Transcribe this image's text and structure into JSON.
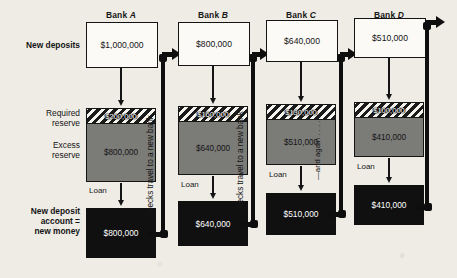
{
  "figure": {
    "type": "flow-diagram",
    "reserve_requirement": "20%"
  },
  "row_labels": {
    "new_deposits": "New deposits",
    "required_reserve": "Required\nreserve",
    "required_reserve_line1": "Required",
    "required_reserve_line2": "reserve",
    "excess_reserve_line1": "Excess",
    "excess_reserve_line2": "reserve",
    "loan": "Loan",
    "new_deposit_account_line1": "New deposit",
    "new_deposit_account_line2": "account =",
    "new_deposit_account_line3": "new money"
  },
  "connector_labels": {
    "checks_travel": "Checks travel to a new bank",
    "and_again": "—and again . . . . ."
  },
  "banks": [
    {
      "title_prefix": "Bank ",
      "title_letter": "A",
      "new_deposit": "$1,000,000",
      "required_reserve": "$200,000",
      "excess_reserve": "$800,000",
      "loan_label": "Loan",
      "new_money": "$800,000"
    },
    {
      "title_prefix": "Bank ",
      "title_letter": "B",
      "new_deposit": "$800,000",
      "required_reserve": "$160,000",
      "excess_reserve": "$640,000",
      "loan_label": "Loan",
      "new_money": "$640,000"
    },
    {
      "title_prefix": "Bank ",
      "title_letter": "C",
      "new_deposit": "$640,000",
      "required_reserve": "$130,000",
      "excess_reserve": "$510,000",
      "loan_label": "Loan",
      "new_money": "$510,000"
    },
    {
      "title_prefix": "Bank ",
      "title_letter": "D",
      "new_deposit": "$510,000",
      "required_reserve": "$100,000",
      "excess_reserve": "$410,000",
      "loan_label": "Loan",
      "new_money": "$410,000"
    }
  ],
  "colors": {
    "background": "#efece6",
    "ink": "#141414",
    "excess_reserve_fill": "#7b7b78",
    "loan_fill": "#101010",
    "deposit_fill": "#fbfaf7"
  }
}
